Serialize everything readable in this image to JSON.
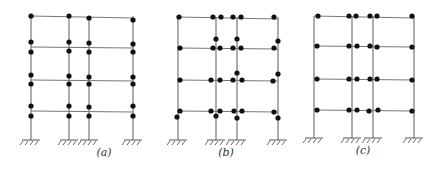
{
  "figure": {
    "colors": {
      "line": "#777777",
      "hinge": "#111111",
      "label": "#333333"
    },
    "frames": [
      {
        "label": "(a)",
        "label_x": 104,
        "columns": [
          31,
          69,
          89,
          133
        ],
        "levels": [
          16,
          47,
          80,
          111
        ],
        "ground": 140,
        "hinges": [
          [
            31,
            16
          ],
          [
            69,
            16
          ],
          [
            89,
            18
          ],
          [
            133,
            20
          ],
          [
            31,
            42
          ],
          [
            69,
            42
          ],
          [
            89,
            43
          ],
          [
            133,
            44
          ],
          [
            31,
            52
          ],
          [
            69,
            51
          ],
          [
            89,
            52
          ],
          [
            133,
            52
          ],
          [
            31,
            75
          ],
          [
            69,
            76
          ],
          [
            89,
            77
          ],
          [
            133,
            77
          ],
          [
            31,
            84
          ],
          [
            69,
            84
          ],
          [
            89,
            84
          ],
          [
            133,
            84
          ],
          [
            31,
            106
          ],
          [
            69,
            106
          ],
          [
            89,
            107
          ],
          [
            133,
            106
          ],
          [
            31,
            116
          ],
          [
            69,
            116
          ],
          [
            89,
            116
          ],
          [
            133,
            116
          ]
        ]
      },
      {
        "label": "(b)",
        "label_x": 226,
        "columns": [
          178,
          216,
          237,
          278
        ],
        "levels": [
          17,
          48,
          80,
          111
        ],
        "ground": 140,
        "hinges": [
          [
            179,
            17
          ],
          [
            213,
            17
          ],
          [
            221,
            17
          ],
          [
            233,
            17
          ],
          [
            241,
            17
          ],
          [
            274,
            17
          ],
          [
            216,
            39
          ],
          [
            237,
            39
          ],
          [
            278,
            41
          ],
          [
            180,
            48
          ],
          [
            213,
            48
          ],
          [
            220,
            48
          ],
          [
            233,
            48
          ],
          [
            241,
            48
          ],
          [
            274,
            48
          ],
          [
            237,
            73
          ],
          [
            278,
            74
          ],
          [
            180,
            80
          ],
          [
            211,
            80
          ],
          [
            220,
            80
          ],
          [
            233,
            80
          ],
          [
            242,
            80
          ],
          [
            273,
            81
          ],
          [
            180,
            111
          ],
          [
            211,
            111
          ],
          [
            220,
            111
          ],
          [
            234,
            111
          ],
          [
            242,
            111
          ],
          [
            274,
            112
          ],
          [
            177,
            117
          ],
          [
            216,
            116
          ],
          [
            237,
            118
          ],
          [
            278,
            118
          ]
        ]
      },
      {
        "label": "(c)",
        "label_x": 363,
        "columns": [
          314,
          352,
          373,
          414
        ],
        "levels": [
          16,
          46,
          79,
          110
        ],
        "ground": 138,
        "hinges": [
          [
            318,
            16
          ],
          [
            349,
            16
          ],
          [
            356,
            16
          ],
          [
            370,
            16
          ],
          [
            377,
            16
          ],
          [
            412,
            16
          ],
          [
            317,
            46
          ],
          [
            349,
            46
          ],
          [
            357,
            46
          ],
          [
            370,
            46
          ],
          [
            377,
            47
          ],
          [
            412,
            47
          ],
          [
            317,
            79
          ],
          [
            349,
            79
          ],
          [
            357,
            79
          ],
          [
            370,
            79
          ],
          [
            377,
            79
          ],
          [
            412,
            80
          ],
          [
            317,
            110
          ],
          [
            349,
            110
          ],
          [
            357,
            110
          ],
          [
            369,
            111
          ],
          [
            378,
            110
          ],
          [
            412,
            111
          ]
        ]
      }
    ]
  }
}
